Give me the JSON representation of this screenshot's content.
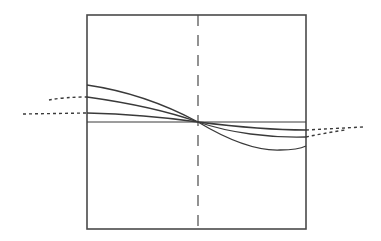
{
  "diagram": {
    "colors": {
      "background": "#ffffff",
      "stroke": "#3a3a3a",
      "frame": "#4a4a4a"
    },
    "frame": {
      "x": 87,
      "y": 15,
      "width": 219,
      "height": 214
    },
    "axis": {
      "x": 198,
      "y1": 15,
      "y2": 229,
      "style": "dashed"
    },
    "crossing_point": {
      "x": 198,
      "y": 122
    },
    "curves": [
      {
        "name": "flat-line",
        "path": "M87,122 L306,122"
      },
      {
        "name": "curve-1",
        "path": "M87,113 C130,114 170,118 198,122 C230,126 270,130 306,130"
      },
      {
        "name": "curve-2",
        "path": "M87,97 C130,103 170,112 198,122 C230,133 270,138 306,137"
      },
      {
        "name": "curve-3",
        "path": "M87,85 C135,92 170,107 198,122 C228,140 255,151 280,150 C295,150 302,148 306,146"
      }
    ],
    "extensions": [
      {
        "name": "left-ext-curve-2",
        "path": "M49,100 Q65,97 87,97"
      },
      {
        "name": "left-ext-curve-1",
        "path": "M23,114 L87,113"
      },
      {
        "name": "right-ext-curve-1",
        "path": "M306,130 L363,127"
      },
      {
        "name": "right-ext-curve-2",
        "path": "M306,137 Q325,133 345,130"
      }
    ]
  }
}
